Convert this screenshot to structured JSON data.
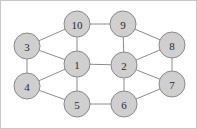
{
  "figure": {
    "background_color": "#ffffff",
    "border_color": "#c8c8c8",
    "width": 197,
    "height": 129
  },
  "chart_data": {
    "type": "diagram",
    "diagram_type": "node-link-graph",
    "directed": false,
    "weighted": false,
    "title": "",
    "node_count": 10,
    "edge_count": 17,
    "node_style": {
      "fill": "#cfcfcf",
      "stroke": "#8a8a8a",
      "radius": 13,
      "label_color": "#2b2b2b"
    },
    "edge_style": {
      "stroke": "#8c8c8c",
      "width": 1
    },
    "nodes": [
      {
        "id": "1",
        "label": "1",
        "x": 77,
        "y": 64,
        "r": 13
      },
      {
        "id": "2",
        "label": "2",
        "x": 124,
        "y": 65,
        "r": 13
      },
      {
        "id": "3",
        "label": "3",
        "x": 27,
        "y": 46,
        "r": 13
      },
      {
        "id": "4",
        "label": "4",
        "x": 27,
        "y": 86,
        "r": 13
      },
      {
        "id": "5",
        "label": "5",
        "x": 77,
        "y": 104,
        "r": 13
      },
      {
        "id": "6",
        "label": "6",
        "x": 124,
        "y": 104,
        "r": 13
      },
      {
        "id": "7",
        "label": "7",
        "x": 172,
        "y": 84,
        "r": 13
      },
      {
        "id": "8",
        "label": "8",
        "x": 172,
        "y": 45,
        "r": 13
      },
      {
        "id": "9",
        "label": "9",
        "x": 123,
        "y": 24,
        "r": 13
      },
      {
        "id": "10",
        "label": "10",
        "x": 77,
        "y": 24,
        "r": 13
      }
    ],
    "edges": [
      {
        "source": "3",
        "target": "10"
      },
      {
        "source": "3",
        "target": "1"
      },
      {
        "source": "3",
        "target": "4"
      },
      {
        "source": "10",
        "target": "9"
      },
      {
        "source": "10",
        "target": "1"
      },
      {
        "source": "4",
        "target": "1"
      },
      {
        "source": "4",
        "target": "5"
      },
      {
        "source": "1",
        "target": "5"
      },
      {
        "source": "1",
        "target": "2"
      },
      {
        "source": "9",
        "target": "2"
      },
      {
        "source": "9",
        "target": "8"
      },
      {
        "source": "8",
        "target": "2"
      },
      {
        "source": "8",
        "target": "7"
      },
      {
        "source": "2",
        "target": "7"
      },
      {
        "source": "2",
        "target": "6"
      },
      {
        "source": "5",
        "target": "6"
      },
      {
        "source": "6",
        "target": "7"
      }
    ],
    "adjacency": {
      "1": [
        "2",
        "3",
        "4",
        "5",
        "10"
      ],
      "2": [
        "1",
        "6",
        "7",
        "8",
        "9"
      ],
      "3": [
        "1",
        "4",
        "10"
      ],
      "4": [
        "1",
        "3",
        "5"
      ],
      "5": [
        "1",
        "4",
        "6"
      ],
      "6": [
        "2",
        "5",
        "7"
      ],
      "7": [
        "2",
        "6",
        "8"
      ],
      "8": [
        "2",
        "7",
        "9"
      ],
      "9": [
        "2",
        "8",
        "10"
      ],
      "10": [
        "1",
        "3",
        "9"
      ]
    }
  }
}
